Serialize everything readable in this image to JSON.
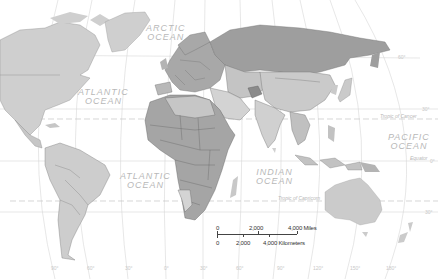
{
  "map": {
    "type": "world political map",
    "colors": {
      "ocean": "#ffffff",
      "land_light": "#cfcfcf",
      "land_mid": "#b9b9b9",
      "land_dark": "#9c9c9c",
      "land_darkest": "#868686",
      "borders": "#6e6e6e",
      "graticule": "#d8d8d8"
    },
    "oceans": [
      {
        "name": "ARCTIC",
        "line2": "OCEAN"
      },
      {
        "name": "ATLANTIC",
        "line2": "OCEAN"
      },
      {
        "name": "ATLANTIC",
        "line2": "OCEAN"
      },
      {
        "name": "INDIAN",
        "line2": "OCEAN"
      },
      {
        "name": "PACIFIC",
        "line2": "OCEAN"
      }
    ],
    "reference_lines": {
      "tropic_of_cancer": "Tropic of Cancer",
      "equator": "Equator",
      "tropic_of_capricorn": "Tropic of Capricorn",
      "lat_60": "60°",
      "lat_30n": "30°",
      "lat_0": "0°",
      "lat_30s": "30°"
    },
    "longitudes": [
      "90°",
      "60°",
      "30°",
      "0°",
      "30°",
      "60°",
      "90°",
      "120°",
      "150°",
      "180°"
    ],
    "scale_bar": {
      "miles": [
        "0",
        "2,000",
        "4,000 Miles"
      ],
      "kilometers": [
        "0",
        "2,000",
        "4,000 Kilometers"
      ]
    }
  }
}
